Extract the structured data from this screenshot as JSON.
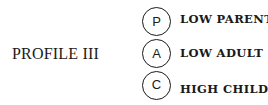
{
  "title": "PROFILE III",
  "states": [
    {
      "letter": "P",
      "label": "LOW PARENT"
    },
    {
      "letter": "A",
      "label": "LOW ADULT"
    },
    {
      "letter": "C",
      "label": "HIGH CHILD"
    }
  ]
}
